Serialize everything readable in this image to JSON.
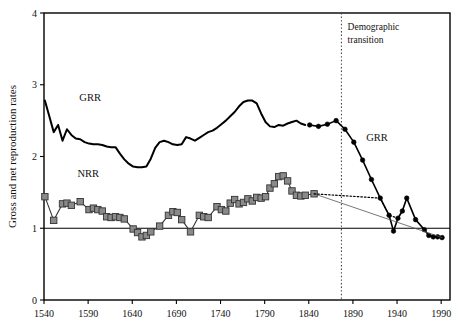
{
  "figure": {
    "background_color": "#ffffff",
    "frame_color": "#000000"
  },
  "chart_data": {
    "type": "line",
    "title": "",
    "xlabel": "",
    "ylabel": "Gross and net reproduction rates",
    "xlim": [
      1540,
      2000
    ],
    "ylim": [
      0,
      4
    ],
    "xticks": [
      1540,
      1590,
      1640,
      1690,
      1740,
      1790,
      1840,
      1890,
      1940,
      1990
    ],
    "yticks": [
      0,
      1,
      2,
      3,
      4
    ],
    "xtick_labels": [
      "1540",
      "1590",
      "1640",
      "1690",
      "1740",
      "1790",
      "1840",
      "1890",
      "1940",
      "1990"
    ],
    "ytick_labels": [
      "0",
      "1",
      "2",
      "3",
      "4"
    ],
    "grid": false,
    "legend_position": "inline-annotations",
    "reference_lines": [
      {
        "name": "replacement-level",
        "orientation": "horizontal",
        "value": 1,
        "style": "solid",
        "color": "#000000"
      },
      {
        "name": "demographic-transition",
        "orientation": "vertical",
        "value": 1877,
        "style": "dotted",
        "color": "#444444"
      }
    ],
    "annotations": [
      {
        "name": "grr-label-left",
        "text": "GRR",
        "x": 1580,
        "y": 2.78
      },
      {
        "name": "nrr-label-left",
        "text": "NRR",
        "x": 1578,
        "y": 1.72
      },
      {
        "name": "grr-label-right",
        "text": "GRR",
        "x": 1905,
        "y": 2.22
      },
      {
        "name": "demographic-transition-label-line1",
        "text": "Demographic",
        "x": 1884,
        "y": 3.76
      },
      {
        "name": "demographic-transition-label-line2",
        "text": "transition",
        "x": 1884,
        "y": 3.58
      }
    ],
    "series": [
      {
        "name": "GRR",
        "label": "GRR",
        "color": "#000000",
        "marker": "none",
        "linewidth": 2.0,
        "points": [
          [
            1541,
            2.78
          ],
          [
            1546,
            2.56
          ],
          [
            1551,
            2.34
          ],
          [
            1556,
            2.44
          ],
          [
            1561,
            2.22
          ],
          [
            1566,
            2.38
          ],
          [
            1571,
            2.3
          ],
          [
            1576,
            2.25
          ],
          [
            1581,
            2.24
          ],
          [
            1586,
            2.2
          ],
          [
            1591,
            2.18
          ],
          [
            1596,
            2.17
          ],
          [
            1601,
            2.17
          ],
          [
            1606,
            2.16
          ],
          [
            1611,
            2.14
          ],
          [
            1616,
            2.13
          ],
          [
            1621,
            2.13
          ],
          [
            1626,
            2.04
          ],
          [
            1631,
            1.96
          ],
          [
            1636,
            1.9
          ],
          [
            1641,
            1.86
          ],
          [
            1646,
            1.85
          ],
          [
            1651,
            1.85
          ],
          [
            1656,
            1.86
          ],
          [
            1661,
            1.97
          ],
          [
            1666,
            2.12
          ],
          [
            1671,
            2.2
          ],
          [
            1676,
            2.22
          ],
          [
            1681,
            2.2
          ],
          [
            1686,
            2.17
          ],
          [
            1691,
            2.16
          ],
          [
            1696,
            2.17
          ],
          [
            1701,
            2.27
          ],
          [
            1706,
            2.25
          ],
          [
            1711,
            2.22
          ],
          [
            1716,
            2.26
          ],
          [
            1721,
            2.3
          ],
          [
            1726,
            2.34
          ],
          [
            1731,
            2.36
          ],
          [
            1736,
            2.4
          ],
          [
            1741,
            2.45
          ],
          [
            1746,
            2.5
          ],
          [
            1751,
            2.56
          ],
          [
            1756,
            2.62
          ],
          [
            1761,
            2.7
          ],
          [
            1766,
            2.76
          ],
          [
            1771,
            2.78
          ],
          [
            1776,
            2.78
          ],
          [
            1781,
            2.74
          ],
          [
            1786,
            2.6
          ],
          [
            1791,
            2.48
          ],
          [
            1796,
            2.42
          ],
          [
            1801,
            2.41
          ],
          [
            1806,
            2.44
          ],
          [
            1811,
            2.43
          ],
          [
            1816,
            2.46
          ],
          [
            1821,
            2.48
          ],
          [
            1826,
            2.5
          ],
          [
            1831,
            2.46
          ],
          [
            1836,
            2.44
          ]
        ]
      },
      {
        "name": "GRR-transition",
        "label": "GRR",
        "color": "#000000",
        "marker": "circle",
        "linewidth": 1.6,
        "points": [
          [
            1841,
            2.44
          ],
          [
            1851,
            2.42
          ],
          [
            1861,
            2.45
          ],
          [
            1871,
            2.5
          ],
          [
            1881,
            2.38
          ],
          [
            1891,
            2.2
          ],
          [
            1901,
            1.95
          ],
          [
            1911,
            1.68
          ],
          [
            1921,
            1.42
          ],
          [
            1931,
            1.18
          ],
          [
            1936,
            0.96
          ],
          [
            1941,
            1.14
          ],
          [
            1946,
            1.24
          ],
          [
            1951,
            1.42
          ],
          [
            1961,
            1.12
          ],
          [
            1971,
            0.98
          ],
          [
            1976,
            0.9
          ],
          [
            1981,
            0.88
          ],
          [
            1986,
            0.88
          ],
          [
            1991,
            0.87
          ]
        ]
      },
      {
        "name": "NRR",
        "label": "NRR",
        "color": "#8a8a8a",
        "edge_color": "#333333",
        "marker": "square",
        "linewidth": 1.1,
        "points": [
          [
            1541,
            1.44
          ],
          [
            1551,
            1.11
          ],
          [
            1561,
            1.34
          ],
          [
            1566,
            1.35
          ],
          [
            1571,
            1.32
          ],
          [
            1581,
            1.37
          ],
          [
            1591,
            1.26
          ],
          [
            1596,
            1.28
          ],
          [
            1601,
            1.26
          ],
          [
            1606,
            1.24
          ],
          [
            1611,
            1.16
          ],
          [
            1616,
            1.15
          ],
          [
            1621,
            1.16
          ],
          [
            1626,
            1.15
          ],
          [
            1631,
            1.13
          ],
          [
            1641,
            0.99
          ],
          [
            1646,
            0.94
          ],
          [
            1651,
            0.88
          ],
          [
            1656,
            0.9
          ],
          [
            1661,
            0.95
          ],
          [
            1671,
            1.03
          ],
          [
            1681,
            1.18
          ],
          [
            1686,
            1.23
          ],
          [
            1691,
            1.22
          ],
          [
            1696,
            1.12
          ],
          [
            1706,
            0.95
          ],
          [
            1716,
            1.18
          ],
          [
            1721,
            1.16
          ],
          [
            1726,
            1.15
          ],
          [
            1736,
            1.3
          ],
          [
            1741,
            1.26
          ],
          [
            1746,
            1.24
          ],
          [
            1751,
            1.35
          ],
          [
            1756,
            1.4
          ],
          [
            1761,
            1.34
          ],
          [
            1766,
            1.36
          ],
          [
            1771,
            1.41
          ],
          [
            1776,
            1.38
          ],
          [
            1781,
            1.43
          ],
          [
            1786,
            1.42
          ],
          [
            1791,
            1.44
          ],
          [
            1796,
            1.56
          ],
          [
            1801,
            1.62
          ],
          [
            1806,
            1.72
          ],
          [
            1811,
            1.73
          ],
          [
            1816,
            1.66
          ],
          [
            1821,
            1.52
          ],
          [
            1826,
            1.46
          ],
          [
            1831,
            1.45
          ],
          [
            1836,
            1.46
          ],
          [
            1846,
            1.48
          ]
        ]
      },
      {
        "name": "NRR-projected",
        "label": "",
        "color": "#555555",
        "marker": "none",
        "linewidth": 0.8,
        "style": "thin-solid",
        "points": [
          [
            1846,
            1.48
          ],
          [
            1991,
            0.87
          ]
        ]
      },
      {
        "name": "NRR-dotted-link",
        "label": "",
        "color": "#000000",
        "marker": "none",
        "linewidth": 1.2,
        "style": "dotted",
        "points": [
          [
            1846,
            1.48
          ],
          [
            1921,
            1.42
          ],
          [
            1931,
            1.18
          ],
          [
            1941,
            1.14
          ]
        ]
      }
    ]
  }
}
